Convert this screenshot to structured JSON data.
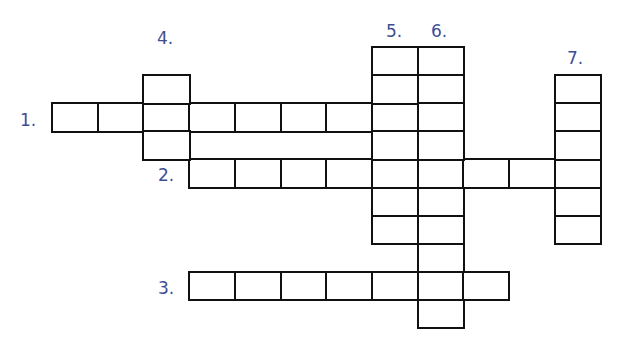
{
  "puzzle": {
    "type": "crossword",
    "label_color": "#3d4e93",
    "grid_line_color": "#111111",
    "cell_width": 45.7,
    "cell_height": 28.1,
    "origin": {
      "x": 52,
      "y": 47
    },
    "clues": [
      {
        "number": "1.",
        "direction": "across",
        "row": 2,
        "col": 0,
        "length": 8,
        "label_pos": {
          "x": 20,
          "y": 112
        }
      },
      {
        "number": "2.",
        "direction": "across",
        "row": 4,
        "col": 3,
        "length": 9,
        "label_pos": {
          "x": 158,
          "y": 167
        }
      },
      {
        "number": "3.",
        "direction": "across",
        "row": 8,
        "col": 3,
        "length": 7,
        "label_pos": {
          "x": 158,
          "y": 280
        }
      },
      {
        "number": "4.",
        "direction": "down",
        "row": 1,
        "col": 2,
        "length": 3,
        "label_pos": {
          "x": 157,
          "y": 30
        }
      },
      {
        "number": "5.",
        "direction": "down",
        "row": 0,
        "col": 7,
        "length": 7,
        "label_pos": {
          "x": 386,
          "y": 23
        }
      },
      {
        "number": "6.",
        "direction": "down",
        "row": 0,
        "col": 8,
        "length": 10,
        "label_pos": {
          "x": 431,
          "y": 23
        }
      },
      {
        "number": "7.",
        "direction": "down",
        "row": 1,
        "col": 11,
        "length": 6,
        "label_pos": {
          "x": 567,
          "y": 50
        }
      }
    ]
  }
}
